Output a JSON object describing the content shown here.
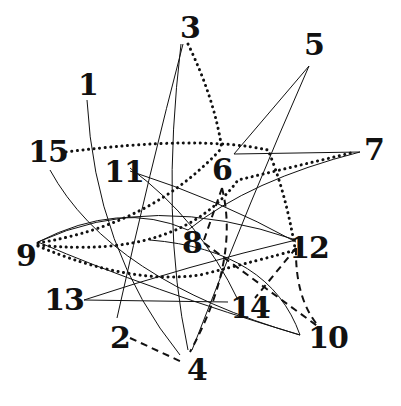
{
  "diagram": {
    "type": "numbered-graph",
    "nodes": [
      {
        "id": "1",
        "label": "1",
        "x": 88,
        "y": 85
      },
      {
        "id": "2",
        "label": "2",
        "x": 120,
        "y": 338
      },
      {
        "id": "3",
        "label": "3",
        "x": 190,
        "y": 28
      },
      {
        "id": "4",
        "label": "4",
        "x": 197,
        "y": 370
      },
      {
        "id": "5",
        "label": "5",
        "x": 314,
        "y": 45
      },
      {
        "id": "6",
        "label": "6",
        "x": 222,
        "y": 170
      },
      {
        "id": "7",
        "label": "7",
        "x": 374,
        "y": 150
      },
      {
        "id": "8",
        "label": "8",
        "x": 192,
        "y": 243
      },
      {
        "id": "9",
        "label": "9",
        "x": 26,
        "y": 256
      },
      {
        "id": "10",
        "label": "10",
        "x": 328,
        "y": 338
      },
      {
        "id": "11",
        "label": "11",
        "x": 124,
        "y": 172
      },
      {
        "id": "12",
        "label": "12",
        "x": 309,
        "y": 248
      },
      {
        "id": "13",
        "label": "13",
        "x": 64,
        "y": 300
      },
      {
        "id": "14",
        "label": "14",
        "x": 250,
        "y": 308
      },
      {
        "id": "15",
        "label": "15",
        "x": 48,
        "y": 152
      }
    ],
    "edge_styles": {
      "solid": "thin solid curve",
      "dotted": "dotted curve",
      "dashed": "dashed line"
    },
    "edges": [
      {
        "from": "1",
        "to": "4",
        "style": "solid"
      },
      {
        "from": "3",
        "to": "2",
        "style": "solid"
      },
      {
        "from": "3",
        "to": "4",
        "style": "solid"
      },
      {
        "from": "3",
        "to": "6",
        "style": "dotted"
      },
      {
        "from": "5",
        "to": "6",
        "style": "solid"
      },
      {
        "from": "5",
        "to": "4",
        "style": "solid"
      },
      {
        "from": "6",
        "to": "7",
        "style": "solid"
      },
      {
        "from": "7",
        "to": "9",
        "style": "solid"
      },
      {
        "from": "15",
        "to": "12",
        "style": "dotted"
      },
      {
        "from": "15",
        "to": "10",
        "style": "solid"
      },
      {
        "from": "11",
        "to": "12",
        "style": "solid"
      },
      {
        "from": "11",
        "to": "14",
        "style": "solid"
      },
      {
        "from": "9",
        "to": "6",
        "style": "dotted"
      },
      {
        "from": "9",
        "to": "7",
        "style": "dotted"
      },
      {
        "from": "9",
        "to": "12",
        "style": "dotted"
      },
      {
        "from": "9",
        "to": "10",
        "style": "solid"
      },
      {
        "from": "13",
        "to": "12",
        "style": "solid"
      },
      {
        "from": "13",
        "to": "14",
        "style": "solid"
      },
      {
        "from": "6",
        "to": "8",
        "style": "dashed"
      },
      {
        "from": "6",
        "to": "4",
        "style": "dashed"
      },
      {
        "from": "8",
        "to": "10",
        "style": "dashed"
      },
      {
        "from": "12",
        "to": "10",
        "style": "dashed"
      },
      {
        "from": "12",
        "to": "14",
        "style": "dashed"
      },
      {
        "from": "2",
        "to": "4",
        "style": "dashed"
      }
    ]
  }
}
